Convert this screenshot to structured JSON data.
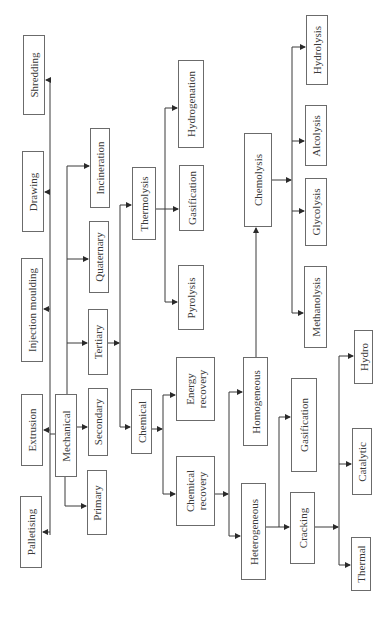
{
  "diagram": {
    "type": "tree",
    "orientation": "rotated-90-ccw",
    "colors": {
      "line": "#3a3a3a",
      "border": "#6b6b6b",
      "text": "#3a3a3a",
      "background": "#ffffff"
    },
    "nodes": {
      "palletising": "Palletising",
      "extrusion": "Extrusion",
      "injection_moulding": "Injection moulding",
      "drawing": "Drawing",
      "shredding": "Shredding",
      "mechanical": "Mechanical",
      "primary": "Primary",
      "secondary": "Secondary",
      "tertiary": "Tertiary",
      "quaternary": "Quaternary",
      "incineration": "Incineration",
      "chemical": "Chemical",
      "thermolysis": "Thermolysis",
      "chemical_recovery": "Chemical\nrecovery",
      "energy_recovery": "Energy\nrecovery",
      "pyrolysis": "Pyrolysis",
      "gasification_thermo": "Gasification",
      "hydrogenation": "Hydrogenation",
      "heterogeneous": "Heterogeneous",
      "homogeneous": "Homogeneous",
      "chemolysis": "Chemolysis",
      "cracking": "Cracking",
      "gasification_hetero": "Gasification",
      "methanolysis": "Methanolysis",
      "glycolysis": "Glycolysis",
      "alcolysis": "Alcolysis",
      "hydrolysis": "Hydrolysis",
      "thermal": "Thermal",
      "catalytic": "Catalytic",
      "hydro": "Hydro"
    },
    "edges": [
      [
        "mechanical",
        "palletising"
      ],
      [
        "mechanical",
        "extrusion"
      ],
      [
        "mechanical",
        "injection_moulding"
      ],
      [
        "mechanical",
        "drawing"
      ],
      [
        "mechanical",
        "shredding"
      ],
      [
        "mechanical",
        "primary"
      ],
      [
        "mechanical",
        "secondary"
      ],
      [
        "mechanical",
        "tertiary"
      ],
      [
        "mechanical",
        "quaternary"
      ],
      [
        "mechanical",
        "incineration"
      ],
      [
        "tertiary",
        "chemical"
      ],
      [
        "tertiary",
        "thermolysis"
      ],
      [
        "thermolysis",
        "pyrolysis"
      ],
      [
        "thermolysis",
        "gasification_thermo"
      ],
      [
        "thermolysis",
        "hydrogenation"
      ],
      [
        "chemical",
        "chemical_recovery"
      ],
      [
        "chemical",
        "energy_recovery"
      ],
      [
        "chemical_recovery",
        "heterogeneous"
      ],
      [
        "chemical_recovery",
        "homogeneous"
      ],
      [
        "homogeneous",
        "chemolysis"
      ],
      [
        "chemolysis",
        "methanolysis"
      ],
      [
        "chemolysis",
        "glycolysis"
      ],
      [
        "chemolysis",
        "alcolysis"
      ],
      [
        "chemolysis",
        "hydrolysis"
      ],
      [
        "heterogeneous",
        "cracking"
      ],
      [
        "heterogeneous",
        "gasification_hetero"
      ],
      [
        "cracking",
        "thermal"
      ],
      [
        "cracking",
        "catalytic"
      ],
      [
        "cracking",
        "hydro"
      ]
    ]
  }
}
